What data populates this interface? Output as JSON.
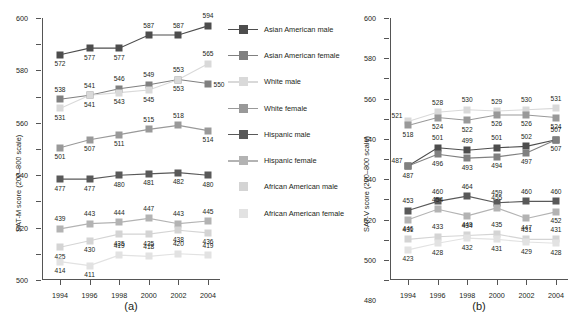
{
  "figure": {
    "caption_a": "(a)",
    "caption_b": "(b)"
  },
  "legend": {
    "items": [
      {
        "label": "Asian American male",
        "color": "#4d4d4d",
        "has_line": true
      },
      {
        "label": "Asian American female",
        "color": "#808080",
        "has_line": true
      },
      {
        "label": "White male",
        "color": "#d9d9d9",
        "has_line": true
      },
      {
        "label": "White female",
        "color": "#999999",
        "has_line": true
      },
      {
        "label": "Hispanic male",
        "color": "#595959",
        "has_line": true
      },
      {
        "label": "Hispanic female",
        "color": "#b3b3b3",
        "has_line": true
      },
      {
        "label": "African American male",
        "color": "#d4d4d4",
        "has_line": false
      },
      {
        "label": "African American female",
        "color": "#e2e2e2",
        "has_line": false
      }
    ]
  },
  "chart_data": [
    {
      "id": "a",
      "type": "line",
      "title": "",
      "caption": "(a)",
      "xlabel": "",
      "ylabel": "SAT-M score (200–800 scale)",
      "x": [
        1994,
        1996,
        1998,
        2000,
        2002,
        2004
      ],
      "xtick_labels": [
        "1994",
        "1996",
        "1998",
        "2000",
        "2002",
        "2004"
      ],
      "ylim": [
        400,
        600
      ],
      "yticks": [
        400,
        420,
        440,
        460,
        480,
        500,
        520,
        540,
        560,
        580,
        600
      ],
      "ytick_labels": [
        "400",
        "420",
        "440",
        "460",
        "480",
        "500",
        "520",
        "540",
        "560",
        "580",
        "600"
      ],
      "grid": false,
      "legend_position": "right",
      "series": [
        {
          "name": "Asian American male",
          "color": "#4d4d4d",
          "values": [
            572,
            577,
            577,
            587,
            587,
            594
          ],
          "label_pos": [
            "below",
            "below",
            "below",
            "above",
            "above",
            "above"
          ]
        },
        {
          "name": "Asian American female",
          "color": "#808080",
          "values": [
            538,
            541,
            546,
            549,
            553,
            550
          ],
          "label_pos": [
            "above",
            "above",
            "above",
            "above",
            "above",
            "right"
          ]
        },
        {
          "name": "White male",
          "color": "#d9d9d9",
          "values": [
            531,
            541,
            543,
            545,
            553,
            565
          ],
          "label_pos": [
            "below",
            "below",
            "below",
            "below",
            "below",
            "above"
          ]
        },
        {
          "name": "White female",
          "color": "#999999",
          "values": [
            501,
            507,
            511,
            515,
            518,
            514
          ],
          "label_pos": [
            "below",
            "below",
            "below",
            "above",
            "above",
            "below"
          ]
        },
        {
          "name": "Hispanic male",
          "color": "#595959",
          "values": [
            477,
            477,
            480,
            481,
            482,
            480
          ],
          "label_pos": [
            "below",
            "below",
            "below",
            "below",
            "below",
            "below"
          ]
        },
        {
          "name": "Hispanic female",
          "color": "#b3b3b3",
          "values": [
            439,
            443,
            444,
            447,
            443,
            445
          ],
          "label_pos": [
            "above",
            "above",
            "above",
            "above",
            "above",
            "above"
          ]
        },
        {
          "name": "African American male",
          "color": "#d4d4d4",
          "values": [
            425,
            430,
            435,
            435,
            438,
            436
          ],
          "label_pos": [
            "below",
            "below",
            "below",
            "below",
            "below",
            "below"
          ]
        },
        {
          "name": "African American female",
          "color": "#e2e2e2",
          "values": [
            414,
            411,
            419,
            418,
            420,
            419
          ],
          "label_pos": [
            "below",
            "below",
            "above",
            "above",
            "above",
            "above"
          ]
        }
      ]
    },
    {
      "id": "b",
      "type": "line",
      "title": "",
      "caption": "(b)",
      "xlabel": "",
      "ylabel": "SAT-V score (200–800 scale)",
      "x": [
        1994,
        1996,
        1998,
        2000,
        2002,
        2004
      ],
      "xtick_labels": [
        "1994",
        "1996",
        "1998",
        "2000",
        "2002",
        "2004"
      ],
      "ylim": [
        400,
        600
      ],
      "yticks": [
        400,
        420,
        440,
        460,
        480,
        500,
        520,
        540,
        560,
        580,
        600
      ],
      "ytick_labels": [
        "400",
        "420",
        "420",
        "440",
        "460",
        "460",
        "480",
        "500",
        "520",
        "540",
        "540",
        "560",
        "580",
        "600"
      ],
      "grid": false,
      "legend_position": "right",
      "series": [
        {
          "name": "Asian American male",
          "color": "#4d4d4d",
          "values": [
            487,
            501,
            499,
            501,
            502,
            507
          ],
          "label_pos": [
            "left",
            "above",
            "above",
            "above",
            "above",
            "above"
          ]
        },
        {
          "name": "Asian American female",
          "color": "#808080",
          "values": [
            487,
            496,
            493,
            494,
            497,
            507
          ],
          "label_pos": [
            "below",
            "below",
            "below",
            "below",
            "below",
            "below"
          ]
        },
        {
          "name": "White male",
          "color": "#d9d9d9",
          "values": [
            521,
            528,
            530,
            529,
            530,
            531
          ],
          "label_pos": [
            "left",
            "above",
            "above",
            "above",
            "above",
            "above"
          ]
        },
        {
          "name": "White female",
          "color": "#999999",
          "values": [
            518,
            524,
            522,
            526,
            526,
            524
          ],
          "label_pos": [
            "below",
            "below",
            "below",
            "below",
            "below",
            "below"
          ]
        },
        {
          "name": "Hispanic male",
          "color": "#595959",
          "values": [
            453,
            460,
            464,
            459,
            460,
            460
          ],
          "label_pos": [
            "above",
            "above",
            "above",
            "above",
            "above",
            "above"
          ]
        },
        {
          "name": "Hispanic female",
          "color": "#b3b3b3",
          "values": [
            446,
            454,
            449,
            455,
            447,
            452
          ],
          "label_pos": [
            "below",
            "above",
            "below",
            "above",
            "below",
            "below"
          ]
        },
        {
          "name": "African American male",
          "color": "#d4d4d4",
          "values": [
            431,
            433,
            434,
            435,
            431,
            431
          ],
          "label_pos": [
            "above",
            "above",
            "above",
            "above",
            "above",
            "above"
          ]
        },
        {
          "name": "African American female",
          "color": "#e2e2e2",
          "values": [
            423,
            428,
            432,
            431,
            429,
            428
          ],
          "label_pos": [
            "below",
            "below",
            "below",
            "below",
            "below",
            "below"
          ]
        }
      ]
    }
  ]
}
